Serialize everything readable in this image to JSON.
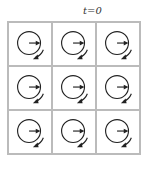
{
  "title": "t=0",
  "grid": {
    "rows": 3,
    "cols": 3,
    "cells": [
      {
        "arrow": "right",
        "rotation": "counterclockwise"
      },
      {
        "arrow": "right",
        "rotation": "counterclockwise"
      },
      {
        "arrow": "right",
        "rotation": "counterclockwise"
      },
      {
        "arrow": "right",
        "rotation": "counterclockwise"
      },
      {
        "arrow": "right",
        "rotation": "counterclockwise"
      },
      {
        "arrow": "right",
        "rotation": "counterclockwise"
      },
      {
        "arrow": "right",
        "rotation": "counterclockwise"
      },
      {
        "arrow": "right",
        "rotation": "counterclockwise"
      },
      {
        "arrow": "right",
        "rotation": "counterclockwise"
      }
    ]
  },
  "colors": {
    "stroke": "#222222",
    "grid": "#bbbbbb"
  }
}
